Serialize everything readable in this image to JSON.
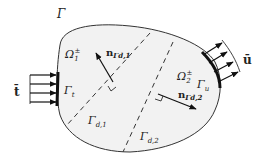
{
  "diagram": {
    "type": "boundary-value-problem-domain",
    "labels": {
      "boundary": "Γ",
      "subdomain1": "Ω",
      "subdomain1_sub": "1",
      "subdomain1_sup": "±",
      "subdomain2": "Ω",
      "subdomain2_sub": "2",
      "subdomain2_sup": "±",
      "traction_boundary": "Γ",
      "traction_boundary_sub": "t",
      "displacement_boundary": "Γ",
      "displacement_boundary_sub": "u",
      "discontinuity1": "Γ",
      "discontinuity1_sub": "d,1",
      "discontinuity2": "Γ",
      "discontinuity2_sub": "d,2",
      "normal1": "n",
      "normal1_sub": "Γd,1",
      "normal2": "n",
      "normal2_sub": "Γd,2",
      "traction": "t̄",
      "displacement": "ū"
    },
    "colors": {
      "domain_fill": "#f2f2f2",
      "stroke": "#222222"
    }
  }
}
